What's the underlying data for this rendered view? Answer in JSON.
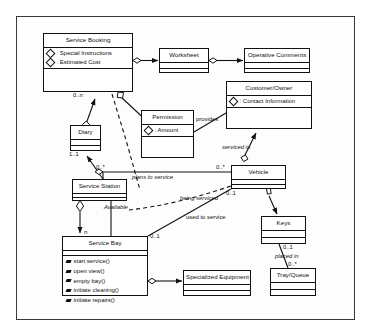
{
  "diagram": {
    "type": "uml-class-diagram"
  },
  "classes": {
    "service_booking": {
      "name": "Service Booking",
      "attributes": [
        ": Special Instructions",
        ": Estimated Cost"
      ]
    },
    "worksheet": {
      "name": "Worksheet",
      "attributes": []
    },
    "operative_comments": {
      "name": "Operative Comments",
      "attributes": []
    },
    "customer_owner": {
      "name": "Customer/Owner",
      "attributes": [
        ": Contact Information"
      ]
    },
    "permission": {
      "name": "Permission",
      "attributes": [
        ": Amount"
      ]
    },
    "diary": {
      "name": "Diary",
      "attributes": []
    },
    "service_station": {
      "name": "Service Station",
      "attributes": []
    },
    "vehicle": {
      "name": "Vehicle",
      "attributes": []
    },
    "keys": {
      "name": "Keys",
      "attributes": []
    },
    "tray_queue": {
      "name": "Tray/Queue",
      "attributes": []
    },
    "service_bay": {
      "name": "Service Bay",
      "operations": [
        "start service()",
        "open view()",
        "empty bay()",
        "initiate cleaning()",
        "initiate repairs()"
      ]
    },
    "specialized_equipment": {
      "name": "Specialized Equipment",
      "attributes": []
    }
  },
  "labels": {
    "mult_booking_diary": "0..n",
    "mult_diary_one": "1..1",
    "provides": "provides",
    "serviced_in": "serviced in",
    "mult_station": "0..*",
    "mult_vehicle_top": "0..*",
    "mult_vehicle_bottom": "0..1",
    "plans_to_service": "plans to service",
    "being_serviced": "being serviced",
    "used_to_service": "used to service",
    "available": "Available",
    "mult_bay_n": "n",
    "mult_bay_01": "0..1",
    "mult_keys": "0..1",
    "placed_in": "placed in",
    "mult_tray": "0..*"
  },
  "colors": {
    "stroke": "#111111",
    "frame": "#3a3a3a",
    "background": "#ffffff"
  }
}
